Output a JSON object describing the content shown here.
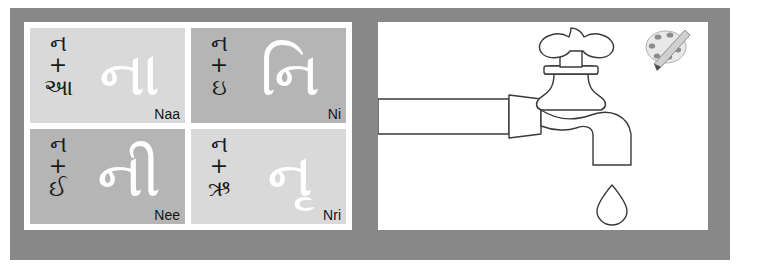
{
  "worksheet": {
    "frame_color": "#888888",
    "background_color": "#ffffff"
  },
  "matra_grid": {
    "cells": [
      {
        "consonant": "ન",
        "plus": "+",
        "vowel": "આ",
        "combined": "ના",
        "roman": "Naa",
        "cell_shade": "#d9d9d9",
        "glyph_color": "#ffffff"
      },
      {
        "consonant": "ન",
        "plus": "+",
        "vowel": "ઇ",
        "combined": "નિ",
        "roman": "Ni",
        "cell_shade": "#b5b5b5",
        "glyph_color": "#ffffff"
      },
      {
        "consonant": "ન",
        "plus": "+",
        "vowel": "ઈ",
        "combined": "ની",
        "roman": "Nee",
        "cell_shade": "#b5b5b5",
        "glyph_color": "#ffffff"
      },
      {
        "consonant": "ન",
        "plus": "+",
        "vowel": "ઋ",
        "combined": "નૃ",
        "roman": "Nri",
        "cell_shade": "#d9d9d9",
        "glyph_color": "#ffffff"
      }
    ]
  },
  "illustration": {
    "name": "water-tap",
    "description": "Line drawing of a water tap with a pipe and a falling water drop",
    "line_color": "#3a3a3a",
    "fill_color": "#ffffff",
    "parts": [
      "pipe",
      "coupling",
      "tap-body",
      "handle",
      "spout",
      "water-drop"
    ],
    "sponge": {
      "name": "sponge-scrubber",
      "color": "#9a9a9a"
    }
  }
}
